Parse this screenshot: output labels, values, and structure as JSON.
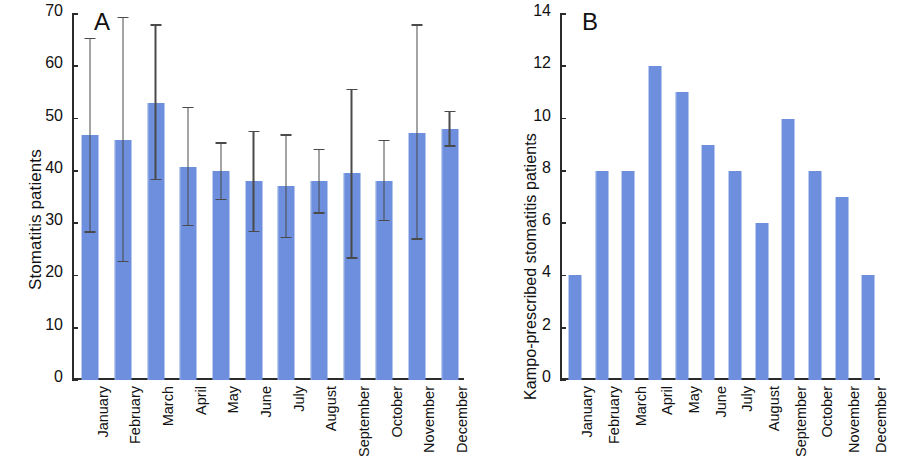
{
  "figure": {
    "width": 897,
    "height": 470,
    "bar_color": "#6d8fdd",
    "axis_color": "#2b2b2b",
    "error_bar_color": "#4a4a4a"
  },
  "chart_data": [
    {
      "type": "bar",
      "panel_label": "A",
      "title": "",
      "xlabel": "",
      "ylabel": "Stomatitis patients",
      "ylim": [
        0,
        70
      ],
      "yticks": [
        0,
        10,
        20,
        30,
        40,
        50,
        60,
        70
      ],
      "grid": false,
      "legend": "none",
      "categories": [
        "January",
        "February",
        "March",
        "April",
        "May",
        "June",
        "July",
        "August",
        "September",
        "October",
        "November",
        "December"
      ],
      "values": [
        46.8,
        45.9,
        53.0,
        40.7,
        40.0,
        38.0,
        37.1,
        38.0,
        39.5,
        38.0,
        47.3,
        48.0
      ],
      "error_upper": [
        65.5,
        69.5,
        68.0,
        52.2,
        45.5,
        47.7,
        47.0,
        44.2,
        55.7,
        46.0,
        68.0,
        51.5
      ],
      "error_lower": [
        28.2,
        22.5,
        38.2,
        29.4,
        34.4,
        28.3,
        27.1,
        31.8,
        23.2,
        30.4,
        26.8,
        44.6
      ],
      "error_type": "range"
    },
    {
      "type": "bar",
      "panel_label": "B",
      "title": "",
      "xlabel": "",
      "ylabel": "Kampo-prescribed stomatitis patients",
      "ylim": [
        0,
        14
      ],
      "yticks": [
        0,
        2,
        4,
        6,
        8,
        10,
        12,
        14
      ],
      "grid": false,
      "legend": "none",
      "categories": [
        "January",
        "February",
        "March",
        "April",
        "May",
        "June",
        "July",
        "August",
        "September",
        "October",
        "November",
        "December"
      ],
      "values": [
        4,
        8,
        8,
        12,
        11,
        9,
        8,
        6,
        10,
        8,
        7,
        4
      ]
    }
  ]
}
